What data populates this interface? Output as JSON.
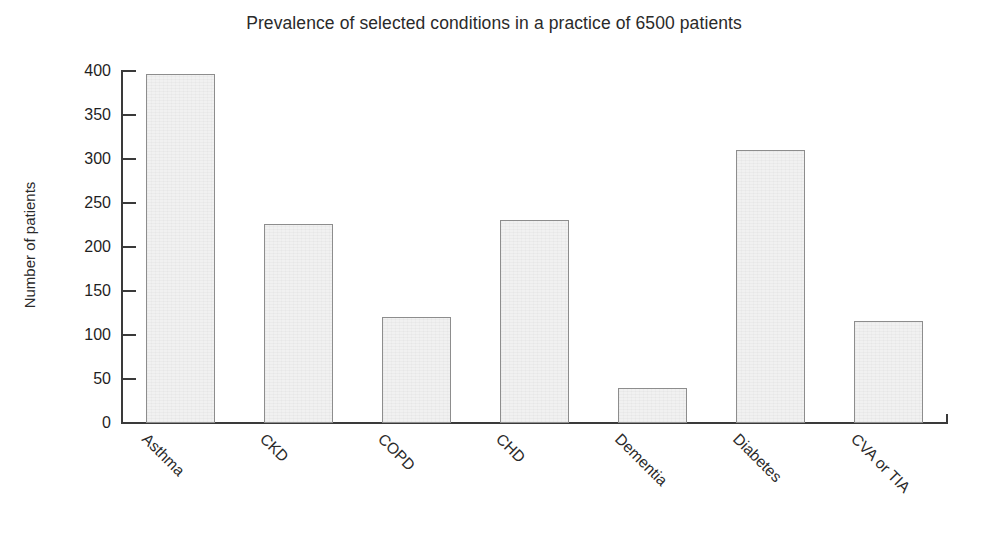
{
  "chart_data": {
    "type": "bar",
    "title": "Prevalence of selected conditions in a practice of 6500 patients",
    "xlabel": "",
    "ylabel": "Number of patients",
    "categories": [
      "Asthma",
      "CKD",
      "COPD",
      "CHD",
      "Dementia",
      "Diabetes",
      "CVA or TIA"
    ],
    "values": [
      397,
      226,
      121,
      231,
      40,
      310,
      116
    ],
    "ylim": [
      0,
      400
    ],
    "ytick_labels": [
      "0",
      "50",
      "100",
      "150",
      "200",
      "250",
      "300",
      "350",
      "400"
    ],
    "ytick_values": [
      0,
      50,
      100,
      150,
      200,
      250,
      300,
      350,
      400
    ],
    "grid": false,
    "legend": false,
    "bar_fill_color": "#f1f1f1",
    "bar_edge_color": "#8d8d8d",
    "axis_color": "#3a3a3a",
    "text_color": "#2a2a2a",
    "background_color": "#ffffff",
    "xtick_label_rotation": 45
  }
}
